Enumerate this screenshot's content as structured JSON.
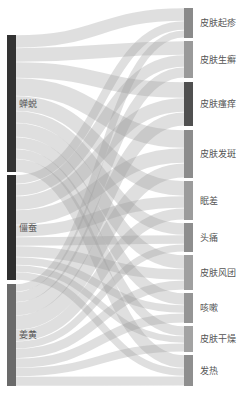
{
  "chart_data": {
    "type": "sankey",
    "title": "",
    "sources": [
      {
        "name": "蝉蜕",
        "y0": 35,
        "y1": 172,
        "color": "#333333"
      },
      {
        "name": "僵蚕",
        "y0": 175,
        "y1": 280,
        "color": "#2e2e2e"
      },
      {
        "name": "姜黄",
        "y0": 284,
        "y1": 386,
        "color": "#6a6a6a"
      }
    ],
    "targets": [
      {
        "name": "皮肤起疹",
        "y0": 8,
        "y1": 38,
        "color": "#8a8a8a"
      },
      {
        "name": "皮肤生癣",
        "y0": 41,
        "y1": 78,
        "color": "#9a9a9a"
      },
      {
        "name": "皮肤瘙痒",
        "y0": 82,
        "y1": 126,
        "color": "#505050"
      },
      {
        "name": "皮肤发斑",
        "y0": 130,
        "y1": 178,
        "color": "#8c8c8c"
      },
      {
        "name": "眠差",
        "y0": 181,
        "y1": 220,
        "color": "#9c9c9c"
      },
      {
        "name": "头痛",
        "y0": 223,
        "y1": 252,
        "color": "#8e8e8e"
      },
      {
        "name": "皮肤风团",
        "y0": 255,
        "y1": 290,
        "color": "#a0a0a0"
      },
      {
        "name": "咳嗽",
        "y0": 293,
        "y1": 323,
        "color": "#959595"
      },
      {
        "name": "皮肤干燥",
        "y0": 326,
        "y1": 352,
        "color": "#a3a3a3"
      },
      {
        "name": "发热",
        "y0": 355,
        "y1": 386,
        "color": "#8f8f8f"
      }
    ],
    "links": [
      [
        13,
        14,
        16,
        18,
        15,
        12,
        14,
        12,
        10,
        13
      ],
      [
        9,
        12,
        14,
        15,
        12,
        9,
        11,
        8,
        7,
        8
      ],
      [
        8,
        11,
        14,
        15,
        12,
        8,
        10,
        10,
        9,
        10
      ]
    ],
    "source_x": 7,
    "source_width": 9,
    "target_x": 184,
    "target_width": 9
  }
}
